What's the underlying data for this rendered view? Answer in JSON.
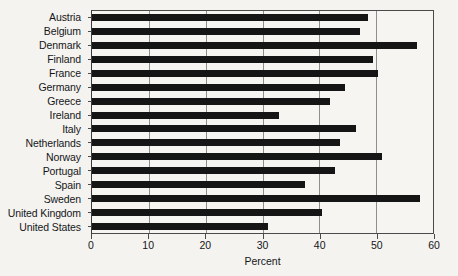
{
  "chart_data": {
    "type": "bar",
    "orientation": "horizontal",
    "title": "",
    "subtitle": "",
    "xlabel": "Percent",
    "ylabel": "",
    "xlim": [
      0,
      60
    ],
    "xticks": [
      0,
      10,
      20,
      30,
      40,
      50,
      60
    ],
    "xticklabels": [
      "0",
      "10",
      "20",
      "30",
      "40",
      "50",
      "60"
    ],
    "grid": "vertical",
    "legend": "none",
    "bar_color": "#151515",
    "categories": [
      "Austria",
      "Belgium",
      "Denmark",
      "Finland",
      "France",
      "Germany",
      "Greece",
      "Ireland",
      "Italy",
      "Netherlands",
      "Norway",
      "Portugal",
      "Spain",
      "Sweden",
      "United Kingdom",
      "United States"
    ],
    "values": [
      48.5,
      47.1,
      57.2,
      49.5,
      50.4,
      44.5,
      41.8,
      32.9,
      46.5,
      43.6,
      51.0,
      42.8,
      37.5,
      57.8,
      40.4,
      31.0
    ]
  }
}
